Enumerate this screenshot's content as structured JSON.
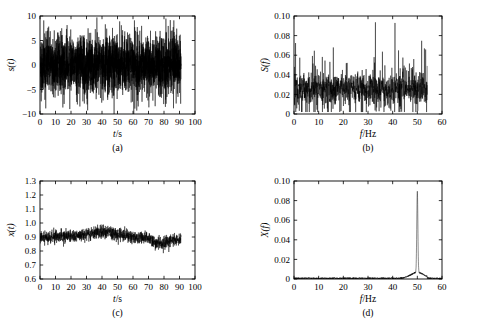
{
  "figure": {
    "background": "#ffffff",
    "trace_color": "#000000",
    "axis_color": "#000000"
  },
  "chart_data": [
    {
      "id": "panel-a",
      "type": "line",
      "caption": "(a)",
      "title": "",
      "xlabel": "t/s",
      "ylabel": "s(t)",
      "xlim": [
        0,
        100
      ],
      "ylim": [
        -10,
        10
      ],
      "xticks": [
        0,
        10,
        20,
        30,
        40,
        50,
        60,
        70,
        80,
        90,
        100
      ],
      "yticks": [
        -10,
        -5,
        0,
        5,
        10
      ],
      "xticklabels": [
        "0",
        "10",
        "20",
        "30",
        "40",
        "50",
        "60",
        "70",
        "80",
        "90",
        "100"
      ],
      "yticklabels": [
        "−10",
        "−5",
        "0",
        "5",
        "10"
      ],
      "grid": false,
      "legend": "none",
      "data_extent_x": [
        0,
        91
      ],
      "description": "Dense broadband noise signal, zero mean, envelope roughly ±6, occasional spikes to ±9",
      "signal": {
        "kind": "noise",
        "mean": 0,
        "amplitude": 3.0,
        "spike_amplitude": 9.0,
        "n_points": 2600,
        "seed": 17
      }
    },
    {
      "id": "panel-b",
      "type": "line",
      "caption": "(b)",
      "title": "",
      "xlabel": "f/Hz",
      "ylabel": "S(f)",
      "xlim": [
        0,
        60
      ],
      "ylim": [
        0,
        0.1
      ],
      "xticks": [
        0,
        10,
        20,
        30,
        40,
        50,
        60
      ],
      "yticks": [
        0,
        0.02,
        0.04,
        0.06,
        0.08,
        0.1
      ],
      "xticklabels": [
        "0",
        "10",
        "20",
        "30",
        "40",
        "50",
        "60"
      ],
      "yticklabels": [
        "0",
        "0.02",
        "0.04",
        "0.06",
        "0.08",
        "0.10"
      ],
      "grid": false,
      "legend": "none",
      "data_extent_x": [
        0,
        54
      ],
      "description": "Flat broadband noise spectrum, mean level about 0.025, peaks up to 0.07, no dominant line",
      "signal": {
        "kind": "spectrum-noise",
        "mean": 0.026,
        "amplitude": 0.013,
        "spike_amplitude": 0.072,
        "n_points": 1200,
        "seed": 43
      }
    },
    {
      "id": "panel-c",
      "type": "line",
      "caption": "(c)",
      "title": "",
      "xlabel": "t/s",
      "ylabel": "x(t)",
      "xlim": [
        0,
        100
      ],
      "ylim": [
        0.6,
        1.3
      ],
      "xticks": [
        0,
        10,
        20,
        30,
        40,
        50,
        60,
        70,
        80,
        90,
        100
      ],
      "yticks": [
        0.6,
        0.7,
        0.8,
        0.9,
        1.0,
        1.1,
        1.2,
        1.3
      ],
      "xticklabels": [
        "0",
        "10",
        "20",
        "30",
        "40",
        "50",
        "60",
        "70",
        "80",
        "90",
        "100"
      ],
      "yticklabels": [
        "0.6",
        "0.7",
        "0.8",
        "0.9",
        "1.0",
        "1.1",
        "1.2",
        "1.3"
      ],
      "grid": false,
      "legend": "none",
      "data_extent_x": [
        0,
        91
      ],
      "description": "Slowly drifting noisy signal centered near 0.90, range about 0.65 to 1.12, fine high-frequency texture",
      "signal": {
        "kind": "drift-noise",
        "mean": 0.9,
        "amplitude": 0.06,
        "drift_amplitude": 0.055,
        "n_points": 1500,
        "seed": 91
      }
    },
    {
      "id": "panel-d",
      "type": "line",
      "caption": "(d)",
      "title": "",
      "xlabel": "f/Hz",
      "ylabel": "X(f)",
      "xlim": [
        0,
        60
      ],
      "ylim": [
        0,
        0.1
      ],
      "xticks": [
        0,
        10,
        20,
        30,
        40,
        50,
        60
      ],
      "yticks": [
        0,
        0.02,
        0.04,
        0.06,
        0.08,
        0.1
      ],
      "xticklabels": [
        "0",
        "10",
        "20",
        "30",
        "40",
        "50",
        "60"
      ],
      "yticklabels": [
        "0",
        "0.02",
        "0.04",
        "0.06",
        "0.08",
        "0.10"
      ],
      "grid": false,
      "legend": "none",
      "data_extent_x": [
        0,
        60
      ],
      "description": "Near-zero flat baseline with a single sharp spectral line at 50 Hz reaching 0.083, on a small broader pedestal",
      "peaks": [
        {
          "frequency": 50,
          "value": 0.083,
          "label": ""
        }
      ],
      "signal": {
        "kind": "single-peak",
        "baseline": 0.0015,
        "peak_frequency": 50,
        "peak_value": 0.083,
        "peak_width": 0.22,
        "pedestal_value": 0.006,
        "pedestal_width": 2.6,
        "n_points": 1400,
        "seed": 7
      }
    }
  ]
}
